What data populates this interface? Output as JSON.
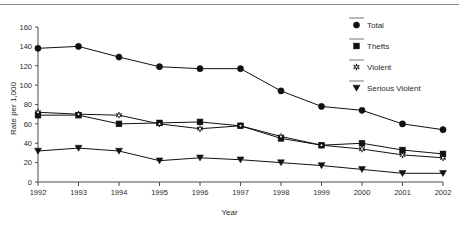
{
  "chart_data": {
    "type": "line",
    "title": "",
    "xlabel": "Year",
    "ylabel": "Rate per 1,000",
    "categories": [
      "1992",
      "1993",
      "1994",
      "1995",
      "1996",
      "1997",
      "1998",
      "1999",
      "2000",
      "2001",
      "2002"
    ],
    "x": [
      1992,
      1993,
      1994,
      1995,
      1996,
      1997,
      1998,
      1999,
      2000,
      2001,
      2002
    ],
    "ylim": [
      0,
      160
    ],
    "yticks": [
      0,
      20,
      40,
      60,
      80,
      100,
      120,
      140,
      160
    ],
    "ytick_labels": [
      "0",
      "20",
      "40",
      "60",
      "80",
      "100",
      "120",
      "140",
      "160"
    ],
    "grid": false,
    "legend_position": "upper right",
    "series": [
      {
        "name": "Total",
        "marker": "circle",
        "color": "#111111",
        "values": [
          138,
          140,
          129,
          119,
          117,
          117,
          94,
          78,
          74,
          60,
          54
        ]
      },
      {
        "name": "Thefts",
        "marker": "square",
        "color": "#111111",
        "values": [
          69,
          69,
          60,
          61,
          62,
          58,
          45,
          38,
          40,
          33,
          29
        ]
      },
      {
        "name": "Violent",
        "marker": "asterisk",
        "color": "#111111",
        "values": [
          72,
          70,
          69,
          60,
          55,
          58,
          47,
          38,
          34,
          28,
          25
        ]
      },
      {
        "name": "Serious Violent",
        "marker": "triangle-down",
        "color": "#111111",
        "values": [
          32,
          35,
          32,
          22,
          25,
          23,
          20,
          17,
          13,
          9,
          9
        ]
      }
    ]
  },
  "legend": {
    "entries": [
      {
        "label": "Total",
        "marker": "circle"
      },
      {
        "label": "Thefts",
        "marker": "square"
      },
      {
        "label": "Violent",
        "marker": "asterisk"
      },
      {
        "label": "Serious Violent",
        "marker": "triangle-down"
      }
    ]
  },
  "colors": {
    "ink": "#111111",
    "axis": "#4d4d4d",
    "rule": "#8a8a8a",
    "background": "#ffffff"
  }
}
